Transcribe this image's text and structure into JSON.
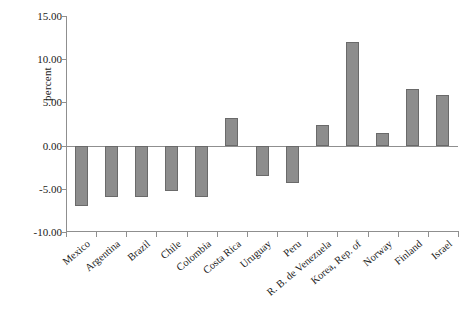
{
  "chart_data": {
    "type": "bar",
    "title": "",
    "subtitle": "",
    "xlabel": "",
    "ylabel": "percent",
    "categories": [
      "Mexico",
      "Argentina",
      "Brazil",
      "Chile",
      "Colombia",
      "Costa Rica",
      "Uruguay",
      "Peru",
      "R. B. de Venezuela",
      "Korea, Rep. of",
      "Norway",
      "Finland",
      "Israel"
    ],
    "values": [
      -7.0,
      -6.0,
      -6.0,
      -5.2,
      -6.0,
      3.2,
      -3.5,
      -4.3,
      2.4,
      12.0,
      1.5,
      6.5,
      5.9
    ],
    "ylim": [
      -10.0,
      15.0
    ],
    "ytick_labels": [
      "15.00",
      "10.00",
      "5.00",
      "0.00",
      "-5.00",
      "-10.00"
    ],
    "ytick_values": [
      15.0,
      10.0,
      5.0,
      0.0,
      -5.0,
      -10.0
    ],
    "grid": false,
    "legend": null,
    "legend_position": "none",
    "bar_color": "#8d8d8d",
    "bar_border_color": "#6a6a6a",
    "axis_color": "#8f8f8f",
    "text_color": "#1a1a1a",
    "background": "#ffffff"
  }
}
